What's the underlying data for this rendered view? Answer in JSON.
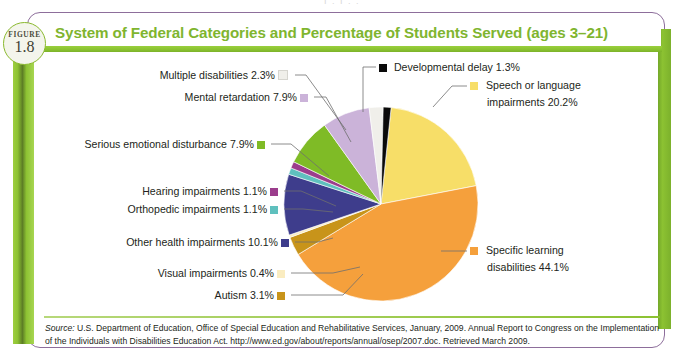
{
  "bleed_text": "I  .   I   .   .",
  "figure": {
    "badge_word": "FIGURE",
    "badge_number": "1.8",
    "title": "System of Federal Categories and Percentage of Students Served (ages 3–21)"
  },
  "source": {
    "label": "Source:",
    "text": " U.S. Department of Education, Office of Special Education and Rehabilitative Services, January, 2009. Annual Report to Congress on the Implementation of the Individuals with Disabilities Education Act. http://www.ed.gov/about/reports/annual/osep/2007.doc. Retrieved March 2009."
  },
  "labels": {
    "multiple_disabilities": "Multiple disabilities 2.3%",
    "mental_retardation": "Mental retardation 7.9%",
    "serious_emotional": "Serious emotional disturbance 7.9%",
    "hearing": "Hearing impairments 1.1%",
    "orthopedic": "Orthopedic impairments 1.1%",
    "other_health": "Other health impairments 10.1%",
    "visual": "Visual impairments 0.4%",
    "autism": "Autism 3.1%",
    "developmental_delay": "Developmental delay 1.3%",
    "speech_line1": "Speech or language",
    "speech_line2": "impairments 20.2%",
    "specific_line1": "Specific learning",
    "specific_line2": "disabilities 44.1%"
  },
  "theme": {
    "frame_border": "#8d6e9b",
    "title_green": "#7fb52f",
    "bar_green": "#8cc232"
  },
  "chart_data": {
    "type": "pie",
    "title": "System of Federal Categories and Percentage of Students Served (ages 3–21)",
    "unit": "percent",
    "legend_position": "callout-labels",
    "start_angle_deg": -84,
    "direction": "clockwise",
    "categories": [
      "Speech or language impairments",
      "Specific learning disabilities",
      "Autism",
      "Visual impairments",
      "Other health impairments",
      "Orthopedic impairments",
      "Hearing impairments",
      "Serious emotional disturbance",
      "Mental retardation",
      "Multiple disabilities",
      "Developmental delay"
    ],
    "values": [
      20.2,
      44.1,
      3.1,
      0.4,
      10.1,
      1.1,
      1.1,
      7.9,
      7.9,
      2.3,
      1.3
    ],
    "colors": [
      "#F7DE68",
      "#F5A03C",
      "#C8941A",
      "#FAECC0",
      "#3E3D8C",
      "#5FC0BE",
      "#9B3D8C",
      "#7FBB26",
      "#CBB3D9",
      "#F0EFEA",
      "#0A0A0A"
    ]
  }
}
